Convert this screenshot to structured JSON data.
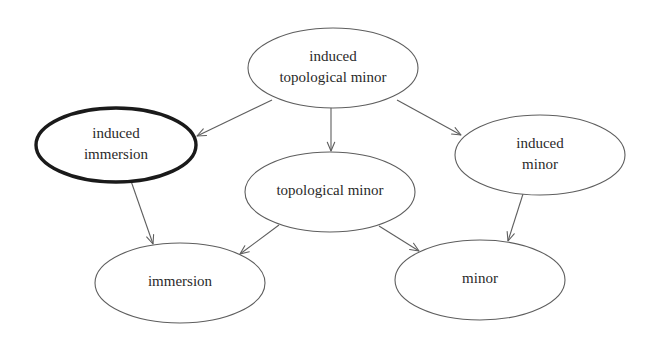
{
  "diagram": {
    "background_color": "#ffffff",
    "thin_stroke_color": "#5e5e5e",
    "bold_stroke_color": "#1a1a1a",
    "text_color": "#2a2a2a",
    "nodes": [
      {
        "id": "induced-topological-minor",
        "lines": [
          "induced",
          "topological minor"
        ],
        "cx": 333,
        "cy": 68,
        "rx": 85,
        "ry": 40,
        "emphasis": "normal",
        "font_size": 15
      },
      {
        "id": "induced-immersion",
        "lines": [
          "induced",
          "immersion"
        ],
        "cx": 116,
        "cy": 145,
        "rx": 80,
        "ry": 37,
        "emphasis": "bold",
        "font_size": 15
      },
      {
        "id": "induced-minor",
        "lines": [
          "induced",
          "minor"
        ],
        "cx": 540,
        "cy": 155,
        "rx": 85,
        "ry": 40,
        "emphasis": "normal",
        "font_size": 15
      },
      {
        "id": "topological-minor",
        "lines": [
          "topological minor"
        ],
        "cx": 330,
        "cy": 192,
        "rx": 85,
        "ry": 40,
        "emphasis": "normal",
        "font_size": 15
      },
      {
        "id": "immersion",
        "lines": [
          "immersion"
        ],
        "cx": 180,
        "cy": 283,
        "rx": 85,
        "ry": 40,
        "emphasis": "normal",
        "font_size": 15
      },
      {
        "id": "minor",
        "lines": [
          "minor"
        ],
        "cx": 480,
        "cy": 280,
        "rx": 85,
        "ry": 40,
        "emphasis": "normal",
        "font_size": 15
      }
    ],
    "edges": [
      {
        "id": "edge-itm-to-ii",
        "from": "induced-topological-minor",
        "to": "induced-immersion",
        "x1": 272,
        "y1": 100,
        "x2": 197,
        "y2": 136
      },
      {
        "id": "edge-itm-to-tm",
        "from": "induced-topological-minor",
        "to": "topological-minor",
        "x1": 331,
        "y1": 108,
        "x2": 331,
        "y2": 151
      },
      {
        "id": "edge-itm-to-im",
        "from": "induced-topological-minor",
        "to": "induced-minor",
        "x1": 397,
        "y1": 100,
        "x2": 461,
        "y2": 135
      },
      {
        "id": "edge-ii-to-immersion",
        "from": "induced-immersion",
        "to": "immersion",
        "x1": 131,
        "y1": 181,
        "x2": 153,
        "y2": 244
      },
      {
        "id": "edge-tm-to-immersion",
        "from": "topological-minor",
        "to": "immersion",
        "x1": 279,
        "y1": 225,
        "x2": 240,
        "y2": 254
      },
      {
        "id": "edge-tm-to-minor",
        "from": "topological-minor",
        "to": "minor",
        "x1": 379,
        "y1": 226,
        "x2": 419,
        "y2": 251
      },
      {
        "id": "edge-im-to-minor",
        "from": "induced-minor",
        "to": "minor",
        "x1": 523,
        "y1": 194,
        "x2": 508,
        "y2": 241
      }
    ]
  }
}
